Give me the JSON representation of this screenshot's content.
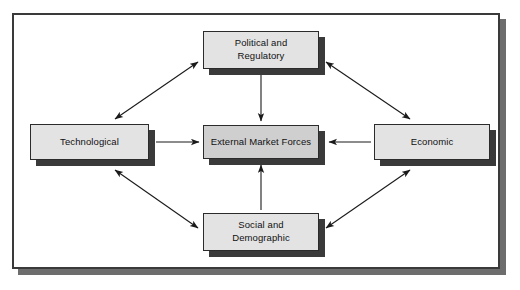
{
  "diagram": {
    "title": "External Market Forces",
    "type": "influence-diagram",
    "frame": {
      "border_color": "#3a3a3a",
      "shadow_color": "#6d6d6d",
      "background": "#ffffff"
    },
    "style": {
      "node_fill": "#e3e3e3",
      "center_node_fill": "#cfcfcf",
      "node_border": "#2b2b2b",
      "node_shadow": "#3a3a3a",
      "connector_color": "#1a1a1a"
    },
    "nodes": [
      {
        "id": "political",
        "label": "Political and\nRegulatory",
        "position": "top"
      },
      {
        "id": "technological",
        "label": "Technological",
        "position": "left"
      },
      {
        "id": "center",
        "label": "External Market Forces",
        "position": "center"
      },
      {
        "id": "economic",
        "label": "Economic",
        "position": "right"
      },
      {
        "id": "social",
        "label": "Social and\nDemographic",
        "position": "bottom"
      }
    ],
    "connections": [
      {
        "from": "political",
        "to": "center",
        "arrow": "single",
        "orientation": "vertical-down"
      },
      {
        "from": "technological",
        "to": "center",
        "arrow": "single",
        "orientation": "horizontal-right"
      },
      {
        "from": "economic",
        "to": "center",
        "arrow": "single",
        "orientation": "horizontal-left"
      },
      {
        "from": "social",
        "to": "center",
        "arrow": "single",
        "orientation": "vertical-up"
      },
      {
        "from": "technological",
        "to": "political",
        "arrow": "double",
        "orientation": "diagonal"
      },
      {
        "from": "political",
        "to": "economic",
        "arrow": "double",
        "orientation": "diagonal"
      },
      {
        "from": "technological",
        "to": "social",
        "arrow": "double",
        "orientation": "diagonal"
      },
      {
        "from": "social",
        "to": "economic",
        "arrow": "double",
        "orientation": "diagonal"
      }
    ]
  }
}
